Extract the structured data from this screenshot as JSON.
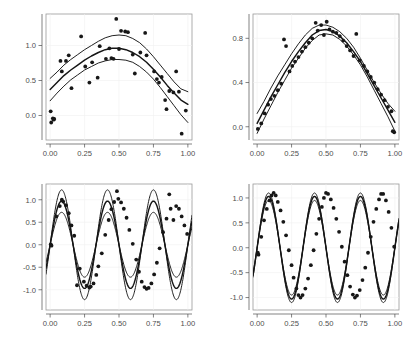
{
  "figure": {
    "width": 415,
    "height": 341,
    "background": "#ffffff",
    "layout": "2x2 grid of scatter plots with fitted curve and confidence bands",
    "point_color": "#171717",
    "curve_color": "#141414",
    "panel_border_color": "#9a9a9a",
    "grid_color": "#f0f0f0",
    "tick_label_color": "#4d4d4d"
  },
  "chart_data": [
    {
      "type": "scatter",
      "panel": "top-left",
      "title": "",
      "xlabel": "",
      "ylabel": "",
      "xlim": [
        -0.03,
        1.03
      ],
      "ylim": [
        -0.35,
        1.45
      ],
      "xticks": [
        0.0,
        0.25,
        0.5,
        0.75,
        1.0
      ],
      "xticklabels": [
        "0.00",
        "0.25",
        "0.50",
        "0.75",
        "1.00"
      ],
      "yticks": [
        0.0,
        0.5,
        1.0
      ],
      "yticklabels": [
        "0.0",
        "0.5",
        "1.0"
      ],
      "grid": true,
      "legend": "none",
      "points": [
        [
          0.004,
          0.06
        ],
        [
          0.008,
          -0.1
        ],
        [
          0.02,
          -0.04
        ],
        [
          0.025,
          -0.06
        ],
        [
          0.03,
          -0.05
        ],
        [
          0.075,
          0.78
        ],
        [
          0.085,
          0.63
        ],
        [
          0.115,
          0.78
        ],
        [
          0.135,
          0.86
        ],
        [
          0.155,
          0.39
        ],
        [
          0.225,
          1.13
        ],
        [
          0.255,
          0.7
        ],
        [
          0.285,
          0.47
        ],
        [
          0.305,
          0.76
        ],
        [
          0.345,
          0.54
        ],
        [
          0.36,
          0.99
        ],
        [
          0.405,
          0.81
        ],
        [
          0.43,
          0.96
        ],
        [
          0.445,
          0.82
        ],
        [
          0.46,
          0.81
        ],
        [
          0.48,
          1.38
        ],
        [
          0.5,
          0.95
        ],
        [
          0.515,
          1.21
        ],
        [
          0.545,
          1.2
        ],
        [
          0.565,
          1.19
        ],
        [
          0.6,
          0.87
        ],
        [
          0.615,
          0.6
        ],
        [
          0.655,
          0.9
        ],
        [
          0.69,
          1.18
        ],
        [
          0.7,
          0.86
        ],
        [
          0.755,
          0.63
        ],
        [
          0.775,
          0.52
        ],
        [
          0.79,
          0.47
        ],
        [
          0.81,
          0.55
        ],
        [
          0.835,
          0.22
        ],
        [
          0.845,
          0.09
        ],
        [
          0.865,
          0.35
        ],
        [
          0.895,
          0.33
        ],
        [
          0.915,
          0.63
        ],
        [
          0.935,
          0.34
        ],
        [
          0.955,
          -0.26
        ],
        [
          0.985,
          0.07
        ]
      ],
      "series": [
        {
          "name": "upper band",
          "role": "upper-confidence",
          "x": [
            0.0,
            0.05,
            0.1,
            0.15,
            0.2,
            0.25,
            0.3,
            0.35,
            0.4,
            0.45,
            0.5,
            0.55,
            0.6,
            0.65,
            0.7,
            0.75,
            0.8,
            0.85,
            0.9,
            0.95,
            1.0
          ],
          "values": [
            0.53,
            0.62,
            0.72,
            0.8,
            0.87,
            0.94,
            1.0,
            1.06,
            1.11,
            1.14,
            1.15,
            1.14,
            1.1,
            1.04,
            0.95,
            0.84,
            0.72,
            0.6,
            0.48,
            0.38,
            0.34
          ]
        },
        {
          "name": "fit",
          "role": "central-fit",
          "x": [
            0.0,
            0.05,
            0.1,
            0.15,
            0.2,
            0.25,
            0.3,
            0.35,
            0.4,
            0.45,
            0.5,
            0.55,
            0.6,
            0.65,
            0.7,
            0.75,
            0.8,
            0.85,
            0.9,
            0.95,
            1.0
          ],
          "values": [
            0.37,
            0.47,
            0.57,
            0.65,
            0.72,
            0.79,
            0.85,
            0.9,
            0.94,
            0.96,
            0.96,
            0.94,
            0.9,
            0.84,
            0.76,
            0.66,
            0.55,
            0.43,
            0.32,
            0.22,
            0.16
          ]
        },
        {
          "name": "lower band",
          "role": "lower-confidence",
          "x": [
            0.0,
            0.05,
            0.1,
            0.15,
            0.2,
            0.25,
            0.3,
            0.35,
            0.4,
            0.45,
            0.5,
            0.55,
            0.6,
            0.65,
            0.7,
            0.75,
            0.8,
            0.85,
            0.9,
            0.95,
            1.0
          ],
          "values": [
            0.21,
            0.32,
            0.42,
            0.51,
            0.58,
            0.65,
            0.7,
            0.75,
            0.78,
            0.8,
            0.8,
            0.79,
            0.76,
            0.7,
            0.62,
            0.52,
            0.4,
            0.27,
            0.14,
            0.01,
            -0.1
          ]
        }
      ]
    },
    {
      "type": "scatter",
      "panel": "top-right",
      "title": "",
      "xlabel": "",
      "ylabel": "",
      "xlim": [
        -0.03,
        1.03
      ],
      "ylim": [
        -0.12,
        1.02
      ],
      "xticks": [
        0.0,
        0.25,
        0.5,
        0.75,
        1.0
      ],
      "xticklabels": [
        "0.00",
        "0.25",
        "0.50",
        "0.75",
        "1.00"
      ],
      "yticks": [
        0.0,
        0.4,
        0.8
      ],
      "yticklabels": [
        "0.0",
        "0.4",
        "0.8"
      ],
      "grid": true,
      "legend": "none",
      "points": [
        [
          0.005,
          -0.02
        ],
        [
          0.03,
          0.03
        ],
        [
          0.055,
          0.12
        ],
        [
          0.08,
          0.2
        ],
        [
          0.1,
          0.25
        ],
        [
          0.125,
          0.28
        ],
        [
          0.15,
          0.33
        ],
        [
          0.175,
          0.39
        ],
        [
          0.195,
          0.79
        ],
        [
          0.21,
          0.73
        ],
        [
          0.235,
          0.5
        ],
        [
          0.255,
          0.55
        ],
        [
          0.275,
          0.59
        ],
        [
          0.3,
          0.63
        ],
        [
          0.325,
          0.68
        ],
        [
          0.35,
          0.72
        ],
        [
          0.375,
          0.76
        ],
        [
          0.4,
          0.8
        ],
        [
          0.425,
          0.94
        ],
        [
          0.44,
          0.87
        ],
        [
          0.465,
          0.92
        ],
        [
          0.485,
          0.83
        ],
        [
          0.505,
          0.95
        ],
        [
          0.525,
          0.88
        ],
        [
          0.55,
          0.86
        ],
        [
          0.575,
          0.85
        ],
        [
          0.6,
          0.82
        ],
        [
          0.625,
          0.78
        ],
        [
          0.65,
          0.73
        ],
        [
          0.675,
          0.69
        ],
        [
          0.7,
          0.64
        ],
        [
          0.72,
          0.84
        ],
        [
          0.745,
          0.6
        ],
        [
          0.775,
          0.55
        ],
        [
          0.8,
          0.5
        ],
        [
          0.825,
          0.45
        ],
        [
          0.85,
          0.4
        ],
        [
          0.875,
          0.34
        ],
        [
          0.9,
          0.29
        ],
        [
          0.925,
          0.24
        ],
        [
          0.95,
          0.18
        ],
        [
          0.975,
          0.14
        ],
        [
          0.985,
          -0.04
        ],
        [
          0.995,
          -0.05
        ]
      ],
      "series": [
        {
          "name": "upper band",
          "role": "upper-confidence",
          "x": [
            0.0,
            0.05,
            0.1,
            0.15,
            0.2,
            0.25,
            0.3,
            0.35,
            0.4,
            0.45,
            0.5,
            0.55,
            0.6,
            0.65,
            0.7,
            0.75,
            0.8,
            0.85,
            0.9,
            0.95,
            1.0
          ],
          "values": [
            0.12,
            0.23,
            0.35,
            0.46,
            0.56,
            0.66,
            0.75,
            0.83,
            0.89,
            0.92,
            0.92,
            0.9,
            0.86,
            0.8,
            0.72,
            0.62,
            0.51,
            0.4,
            0.3,
            0.21,
            0.14
          ]
        },
        {
          "name": "fit",
          "role": "central-fit",
          "x": [
            0.0,
            0.05,
            0.1,
            0.15,
            0.2,
            0.25,
            0.3,
            0.35,
            0.4,
            0.45,
            0.5,
            0.55,
            0.6,
            0.65,
            0.7,
            0.75,
            0.8,
            0.85,
            0.9,
            0.95,
            1.0
          ],
          "values": [
            0.03,
            0.15,
            0.27,
            0.38,
            0.49,
            0.59,
            0.68,
            0.76,
            0.83,
            0.87,
            0.88,
            0.86,
            0.82,
            0.76,
            0.68,
            0.59,
            0.48,
            0.37,
            0.26,
            0.15,
            0.04
          ]
        },
        {
          "name": "lower band",
          "role": "lower-confidence",
          "x": [
            0.0,
            0.05,
            0.1,
            0.15,
            0.2,
            0.25,
            0.3,
            0.35,
            0.4,
            0.45,
            0.5,
            0.55,
            0.6,
            0.65,
            0.7,
            0.75,
            0.8,
            0.85,
            0.9,
            0.95,
            1.0
          ],
          "values": [
            -0.06,
            0.07,
            0.19,
            0.31,
            0.42,
            0.53,
            0.62,
            0.71,
            0.78,
            0.83,
            0.84,
            0.83,
            0.79,
            0.73,
            0.65,
            0.56,
            0.45,
            0.33,
            0.21,
            0.09,
            -0.04
          ]
        }
      ]
    },
    {
      "type": "scatter",
      "panel": "bottom-left",
      "title": "",
      "xlabel": "",
      "ylabel": "",
      "xlim": [
        -0.03,
        1.03
      ],
      "ylim": [
        -1.45,
        1.35
      ],
      "xticks": [
        0.0,
        0.25,
        0.5,
        0.75,
        1.0
      ],
      "xticklabels": [
        "0.00",
        "0.25",
        "0.50",
        "0.75",
        "1.00"
      ],
      "yticks": [
        -1.0,
        -0.5,
        0.0,
        0.5,
        1.0
      ],
      "yticklabels": [
        "-1.0",
        "-0.5",
        "0.0",
        "0.5",
        "1.0"
      ],
      "grid": true,
      "legend": "none",
      "description": "three-cycle sine with wide confidence bands",
      "points": [
        [
          0.005,
          0.01
        ],
        [
          0.01,
          -0.02
        ],
        [
          0.045,
          0.63
        ],
        [
          0.07,
          0.86
        ],
        [
          0.085,
          1.0
        ],
        [
          0.095,
          0.96
        ],
        [
          0.115,
          0.88
        ],
        [
          0.135,
          0.7
        ],
        [
          0.155,
          0.43
        ],
        [
          0.175,
          0.2
        ],
        [
          0.195,
          -0.9
        ],
        [
          0.215,
          -0.53
        ],
        [
          0.245,
          -0.82
        ],
        [
          0.265,
          -0.91
        ],
        [
          0.285,
          -0.95
        ],
        [
          0.295,
          -0.93
        ],
        [
          0.315,
          -0.86
        ],
        [
          0.335,
          -0.67
        ],
        [
          0.35,
          -0.48
        ],
        [
          0.375,
          -0.19
        ],
        [
          0.4,
          0.22
        ],
        [
          0.425,
          0.55
        ],
        [
          0.445,
          0.79
        ],
        [
          0.465,
          0.95
        ],
        [
          0.485,
          1.19
        ],
        [
          0.495,
          1.02
        ],
        [
          0.515,
          0.94
        ],
        [
          0.535,
          0.8
        ],
        [
          0.555,
          0.6
        ],
        [
          0.575,
          0.33
        ],
        [
          0.6,
          0.02
        ],
        [
          0.625,
          -0.33
        ],
        [
          0.645,
          -0.6
        ],
        [
          0.665,
          -0.82
        ],
        [
          0.685,
          -0.94
        ],
        [
          0.7,
          -0.98
        ],
        [
          0.715,
          -0.96
        ],
        [
          0.735,
          -0.86
        ],
        [
          0.755,
          -0.66
        ],
        [
          0.775,
          -0.4
        ],
        [
          0.795,
          -0.08
        ],
        [
          0.82,
          0.28
        ],
        [
          0.845,
          0.58
        ],
        [
          0.865,
          1.12
        ],
        [
          0.875,
          0.8
        ],
        [
          0.895,
          0.55
        ],
        [
          0.915,
          0.86
        ],
        [
          0.935,
          0.8
        ],
        [
          0.955,
          0.63
        ],
        [
          0.975,
          0.43
        ],
        [
          0.995,
          0.24
        ]
      ],
      "series": [
        {
          "name": "upper band",
          "role": "upper-confidence",
          "amplitude": 1.22,
          "cycles": 3,
          "phase_shift": 0.0
        },
        {
          "name": "fit",
          "role": "central-fit",
          "amplitude": 0.97,
          "cycles": 3,
          "phase_shift": 0.0
        },
        {
          "name": "lower band",
          "role": "lower-confidence",
          "amplitude": 0.72,
          "cycles": 3,
          "phase_shift": 0.0
        }
      ]
    },
    {
      "type": "scatter",
      "panel": "bottom-right",
      "title": "",
      "xlabel": "",
      "ylabel": "",
      "xlim": [
        -0.03,
        1.03
      ],
      "ylim": [
        -1.25,
        1.28
      ],
      "xticks": [
        0.0,
        0.25,
        0.5,
        0.75,
        1.0
      ],
      "xticklabels": [
        "0.00",
        "0.25",
        "0.50",
        "0.75",
        "1.00"
      ],
      "yticks": [
        -1.0,
        -0.5,
        0.0,
        0.5,
        1.0
      ],
      "yticklabels": [
        "-1.0",
        "-0.5",
        "0.0",
        "0.5",
        "1.0"
      ],
      "grid": true,
      "legend": "none",
      "description": "three-cycle sine with very tight confidence bands",
      "points": [
        [
          0.005,
          -0.1
        ],
        [
          0.01,
          -0.14
        ],
        [
          0.03,
          0.22
        ],
        [
          0.05,
          0.55
        ],
        [
          0.07,
          0.78
        ],
        [
          0.09,
          0.95
        ],
        [
          0.105,
          1.05
        ],
        [
          0.12,
          1.1
        ],
        [
          0.135,
          1.05
        ],
        [
          0.15,
          0.92
        ],
        [
          0.17,
          0.75
        ],
        [
          0.19,
          0.52
        ],
        [
          0.21,
          0.25
        ],
        [
          0.23,
          -0.05
        ],
        [
          0.25,
          -0.35
        ],
        [
          0.265,
          -0.6
        ],
        [
          0.285,
          -0.82
        ],
        [
          0.3,
          -0.95
        ],
        [
          0.315,
          -1.0
        ],
        [
          0.33,
          -0.95
        ],
        [
          0.35,
          -0.82
        ],
        [
          0.37,
          -0.62
        ],
        [
          0.39,
          -0.35
        ],
        [
          0.41,
          -0.05
        ],
        [
          0.43,
          0.28
        ],
        [
          0.45,
          0.58
        ],
        [
          0.47,
          0.82
        ],
        [
          0.485,
          1.0
        ],
        [
          0.5,
          1.1
        ],
        [
          0.515,
          1.08
        ],
        [
          0.535,
          0.97
        ],
        [
          0.555,
          0.8
        ],
        [
          0.575,
          0.58
        ],
        [
          0.595,
          0.32
        ],
        [
          0.615,
          0.02
        ],
        [
          0.635,
          -0.28
        ],
        [
          0.655,
          -0.55
        ],
        [
          0.675,
          -0.78
        ],
        [
          0.695,
          -0.94
        ],
        [
          0.71,
          -1.0
        ],
        [
          0.725,
          -0.96
        ],
        [
          0.745,
          -0.85
        ],
        [
          0.765,
          -0.65
        ],
        [
          0.785,
          -0.4
        ],
        [
          0.805,
          -0.1
        ],
        [
          0.825,
          0.22
        ],
        [
          0.845,
          0.52
        ],
        [
          0.865,
          0.78
        ],
        [
          0.885,
          0.97
        ],
        [
          0.9,
          1.08
        ],
        [
          0.915,
          1.08
        ],
        [
          0.935,
          0.95
        ],
        [
          0.955,
          0.72
        ],
        [
          0.975,
          0.4
        ],
        [
          0.995,
          0.02
        ]
      ],
      "series": [
        {
          "name": "upper band",
          "role": "upper-confidence",
          "amplitude": 1.1,
          "cycles": 3,
          "phase_shift": 0.0
        },
        {
          "name": "fit",
          "role": "central-fit",
          "amplitude": 1.03,
          "cycles": 3,
          "phase_shift": 0.0
        },
        {
          "name": "lower band",
          "role": "lower-confidence",
          "amplitude": 0.95,
          "cycles": 3,
          "phase_shift": 0.0
        }
      ]
    }
  ]
}
